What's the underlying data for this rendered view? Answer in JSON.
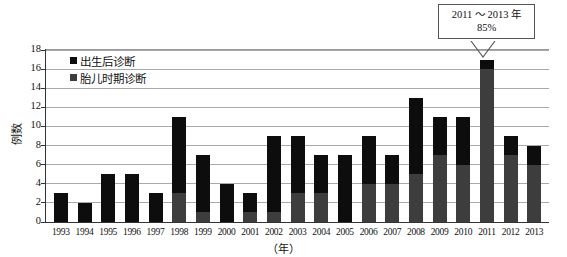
{
  "chart_data": {
    "type": "bar",
    "title": "",
    "subtitle": "",
    "xlabel": "（年）",
    "ylabel": "例数",
    "ylim": [
      0,
      18
    ],
    "ytick_step": 2,
    "yticks": [
      "0",
      "2",
      "4",
      "6",
      "8",
      "10",
      "12",
      "14",
      "16",
      "18"
    ],
    "grid": true,
    "stacked": true,
    "legend_position": "inside-top-left",
    "categories": [
      "1993",
      "1994",
      "1995",
      "1996",
      "1997",
      "1998",
      "1999",
      "2000",
      "2001",
      "2002",
      "2003",
      "2004",
      "2005",
      "2006",
      "2007",
      "2008",
      "2009",
      "2010",
      "2011",
      "2012",
      "2013"
    ],
    "series": [
      {
        "name": "胎儿时期诊断",
        "color": "#3d3d3d",
        "stack_position": "bottom",
        "values": [
          0,
          0,
          0,
          0,
          0,
          3,
          1,
          0,
          1,
          1,
          3,
          3,
          0,
          4,
          4,
          5,
          7,
          6,
          16,
          7,
          6
        ]
      },
      {
        "name": "出生后诊断",
        "color": "#0d0d0d",
        "stack_position": "top",
        "values": [
          3,
          2,
          5,
          5,
          3,
          8,
          6,
          4,
          2,
          8,
          6,
          4,
          7,
          5,
          3,
          8,
          4,
          5,
          1,
          2,
          2
        ]
      }
    ],
    "totals": [
      3,
      2,
      5,
      5,
      3,
      11,
      7,
      4,
      3,
      9,
      9,
      7,
      7,
      9,
      7,
      13,
      11,
      11,
      17,
      9,
      8
    ],
    "annotations": [
      {
        "name": "callout-2011-2013",
        "line1": "2011 ～ 2013 年",
        "line2": "85%",
        "points_to_category": "2011"
      }
    ]
  },
  "legend": {
    "items": [
      {
        "label": "出生后诊断",
        "swatch": "postnatal"
      },
      {
        "label": "胎儿时期诊断",
        "swatch": "fetal"
      }
    ]
  },
  "axes": {
    "y_title": "例数",
    "x_title": "（年）"
  }
}
